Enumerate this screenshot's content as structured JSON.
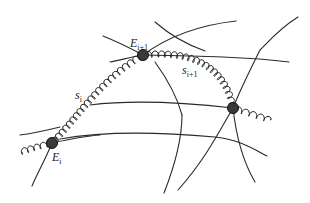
{
  "diagram": {
    "type": "spring-network",
    "labels": {
      "node_i": {
        "base": "E",
        "sub": "i"
      },
      "node_i1": {
        "base": "E",
        "sub": "i+1"
      },
      "spring_i": {
        "base": "s",
        "sub": "i"
      },
      "spring_i1": {
        "base": "s",
        "sub": "i+1"
      }
    },
    "nodes": [
      {
        "id": "E_i",
        "x": 52,
        "y": 143
      },
      {
        "id": "E_i+1",
        "x": 143,
        "y": 55
      },
      {
        "id": "E_i+2",
        "x": 233,
        "y": 108
      }
    ],
    "springs": [
      {
        "id": "s_i",
        "from": "E_i",
        "to": "E_i+1"
      },
      {
        "id": "s_i+1",
        "from": "E_i+1",
        "to": "E_i+2"
      }
    ],
    "colors": {
      "line": "#2a2a2a",
      "node": "#3a3a3a",
      "background": "#ffffff"
    }
  }
}
